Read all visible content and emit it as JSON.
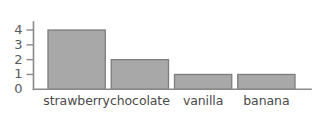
{
  "chart_data": {
    "type": "bar",
    "title": "",
    "subtitle": "",
    "xlabel": "",
    "ylabel": "",
    "categories": [
      "strawberry",
      "chocolate",
      "vanilla",
      "banana"
    ],
    "values": [
      4,
      2,
      1,
      1
    ],
    "ylim": [
      0,
      4
    ],
    "ytick_labels": [
      "0",
      "1",
      "2",
      "3",
      "4"
    ],
    "ytick_values": [
      0,
      1,
      2,
      3,
      4
    ],
    "grid": false,
    "legend": null,
    "orientation": "vertical",
    "bar_color": "#a8a8a8",
    "bar_outline_color": "#7d7d7d",
    "axis_color": "#8a8a8a",
    "label_color": "#4a4a4a",
    "background_color": "#ffffff"
  }
}
